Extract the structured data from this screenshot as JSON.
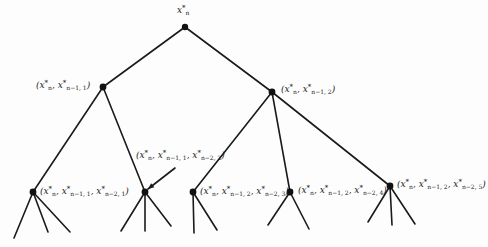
{
  "diagram": {
    "type": "tree",
    "colors": {
      "line": "#1a1a1a",
      "node": "#111111",
      "background": "#fdfdfd"
    },
    "nodes": [
      {
        "id": "root",
        "x": 185,
        "y": 27,
        "label": "x_n*",
        "parts": [
          {
            "base": "x",
            "sub": "n",
            "sup": "*"
          }
        ]
      },
      {
        "id": "n1",
        "x": 103,
        "y": 87,
        "parent": "root",
        "label": "(x_n*, x*_{n-1,1})",
        "parts": [
          {
            "base": "x",
            "sub": "n",
            "sup": "*"
          },
          {
            "base": "x",
            "sub": "n−1, 1",
            "sup": "*"
          }
        ]
      },
      {
        "id": "n2",
        "x": 272,
        "y": 92,
        "parent": "root",
        "label": "(x_n*, x*_{n-1,2})",
        "parts": [
          {
            "base": "x",
            "sub": "n",
            "sup": "*"
          },
          {
            "base": "x",
            "sub": "n−1, 2",
            "sup": "*"
          }
        ]
      },
      {
        "id": "n11",
        "x": 33,
        "y": 192,
        "parent": "n1",
        "label": "(x_n*, x*_{n-1,1}, x*_{n-2,1})",
        "parts": [
          {
            "base": "x",
            "sub": "n",
            "sup": "*"
          },
          {
            "base": "x",
            "sub": "n−1, 1",
            "sup": "*"
          },
          {
            "base": "x",
            "sub": "n−2, 1",
            "sup": "*"
          }
        ]
      },
      {
        "id": "n12",
        "x": 145,
        "y": 192,
        "parent": "n1",
        "label": "(x_n*, x*_{n-1,1}, x*_{n-2,2})",
        "parts": [
          {
            "base": "x",
            "sub": "n",
            "sup": "*"
          },
          {
            "base": "x",
            "sub": "n−1, 1",
            "sup": "*"
          },
          {
            "base": "x",
            "sub": "n−2, 2",
            "sup": "*"
          }
        ]
      },
      {
        "id": "n23",
        "x": 193,
        "y": 192,
        "parent": "n2",
        "label": "(x_n*, x*_{n-1,2}, x*_{n-2,3})",
        "parts": [
          {
            "base": "x",
            "sub": "n",
            "sup": "*"
          },
          {
            "base": "x",
            "sub": "n−1, 2",
            "sup": "*"
          },
          {
            "base": "x",
            "sub": "n−2, 3",
            "sup": "*"
          }
        ]
      },
      {
        "id": "n24",
        "x": 290,
        "y": 192,
        "parent": "n2",
        "label": "(x_n*, x*_{n-1,2}, x*_{n-2,4})",
        "parts": [
          {
            "base": "x",
            "sub": "n",
            "sup": "*"
          },
          {
            "base": "x",
            "sub": "n−1, 2",
            "sup": "*"
          },
          {
            "base": "x",
            "sub": "n−2, 4",
            "sup": "*"
          }
        ]
      },
      {
        "id": "n25",
        "x": 390,
        "y": 186,
        "parent": "n2",
        "label": "(x_n*, x*_{n-1,2}, x*_{n-2,5})",
        "parts": [
          {
            "base": "x",
            "sub": "n",
            "sup": "*"
          },
          {
            "base": "x",
            "sub": "n−1, 2",
            "sup": "*"
          },
          {
            "base": "x",
            "sub": "n−2, 5",
            "sup": "*"
          }
        ]
      }
    ],
    "leaf_stubs": [
      {
        "from": "n11",
        "to": [
          [
            14,
            238
          ],
          [
            48,
            232
          ],
          [
            70,
            232
          ]
        ]
      },
      {
        "from": "n12",
        "to": [
          [
            121,
            231
          ],
          [
            145,
            231
          ],
          [
            171,
            226
          ]
        ]
      },
      {
        "from": "n23",
        "to": [
          [
            194,
            233
          ],
          [
            217,
            230
          ]
        ]
      },
      {
        "from": "n24",
        "to": [
          [
            268,
            225
          ],
          [
            309,
            229
          ]
        ]
      },
      {
        "from": "n25",
        "to": [
          [
            368,
            222
          ],
          [
            392,
            225
          ],
          [
            415,
            224
          ]
        ]
      }
    ],
    "label_positions": {
      "root": {
        "left": 177,
        "top": 5
      },
      "n1": {
        "left": 36,
        "top": 80
      },
      "n2": {
        "left": 281,
        "top": 84
      },
      "n11": {
        "left": 40,
        "top": 186
      },
      "n12": {
        "left": 136,
        "top": 150
      },
      "n23": {
        "left": 200,
        "top": 186
      },
      "n24": {
        "left": 298,
        "top": 185
      },
      "n25": {
        "left": 397,
        "top": 179
      }
    },
    "pointer_arrow": {
      "from": [
        175,
        168
      ],
      "to": [
        148,
        189
      ],
      "target": "n12"
    }
  }
}
